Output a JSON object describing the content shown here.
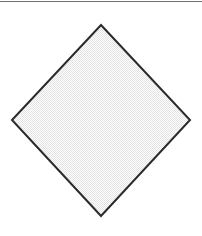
{
  "canvas": {
    "width": 202,
    "height": 236,
    "background_color": "#ffffff"
  },
  "top_rule": {
    "name": "top-divider-rule",
    "color": "#6f6f6f",
    "thickness": 1,
    "y": 1,
    "x_start": 0,
    "x_end": 202
  },
  "figure": {
    "shape_name": "diamond",
    "stroke_color": "#2a2a2a",
    "stroke_width": 2,
    "fill_color": "#f0f0f0",
    "fill_texture": "dithered-checkerboard",
    "vertices": [
      {
        "label": "top",
        "x": 101,
        "y": 25
      },
      {
        "label": "right",
        "x": 190,
        "y": 120
      },
      {
        "label": "bottom",
        "x": 101,
        "y": 216
      },
      {
        "label": "left",
        "x": 12,
        "y": 120
      }
    ],
    "points_attr": "101,25 190,120 101,216 12,120",
    "width": 178,
    "height": 191
  }
}
